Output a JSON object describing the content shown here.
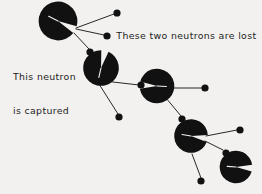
{
  "figure": {
    "kind": "fission-chain-reaction-diagram",
    "background_color": "#f2f1ef",
    "ink_color": "#111111",
    "text_color": "#1d1d1d",
    "width": 262,
    "height": 194,
    "labels": {
      "lost_neutrons": "These two neutrons are lost",
      "captured_neutron_line1": "This neutron",
      "captured_neutron_line2": "is captured"
    },
    "nuclei": [
      {
        "id": "nucleus-1",
        "cx": 58,
        "cy": 21,
        "r": 19,
        "notch_center_deg": 27,
        "notch_half_width_deg": 11
      },
      {
        "id": "nucleus-2",
        "cx": 101,
        "cy": 68,
        "r": 17.5,
        "notch_center_deg": 283,
        "notch_half_width_deg": 12
      },
      {
        "id": "nucleus-3",
        "cx": 157,
        "cy": 86,
        "r": 17,
        "notch_center_deg": 183,
        "notch_half_width_deg": 12
      },
      {
        "id": "nucleus-4",
        "cx": 191,
        "cy": 136,
        "r": 16.5,
        "notch_center_deg": 9,
        "notch_half_width_deg": 12
      },
      {
        "id": "nucleus-5",
        "cx": 236,
        "cy": 167,
        "r": 16,
        "notch_center_deg": 4,
        "notch_half_width_deg": 12
      }
    ],
    "neutrons": [
      {
        "id": "neutron-lost-1",
        "cx": 117,
        "cy": 13,
        "r": 3.6,
        "role": "lost"
      },
      {
        "id": "neutron-lost-2",
        "cx": 107,
        "cy": 36,
        "r": 3.6,
        "role": "lost"
      },
      {
        "id": "neutron-captured-1",
        "cx": 90,
        "cy": 52,
        "r": 3.6,
        "role": "captured"
      },
      {
        "id": "neutron-lost-3",
        "cx": 119,
        "cy": 117,
        "r": 3.6,
        "role": "lost"
      },
      {
        "id": "neutron-captured-2",
        "cx": 141,
        "cy": 85,
        "r": 3.6,
        "role": "captured"
      },
      {
        "id": "neutron-lost-4",
        "cx": 205,
        "cy": 88,
        "r": 3.6,
        "role": "lost"
      },
      {
        "id": "neutron-captured-3",
        "cx": 182,
        "cy": 119,
        "r": 3.6,
        "role": "captured"
      },
      {
        "id": "neutron-lost-5",
        "cx": 240,
        "cy": 130,
        "r": 3.6,
        "role": "lost"
      },
      {
        "id": "neutron-captured-4",
        "cx": 226,
        "cy": 153,
        "r": 3.6,
        "role": "captured"
      },
      {
        "id": "neutron-lost-6",
        "cx": 201,
        "cy": 181,
        "r": 3.6,
        "role": "lost"
      }
    ],
    "tracks": [
      {
        "id": "track-1-lost-1",
        "x1": 76,
        "y1": 28,
        "x2": 114,
        "y2": 14
      },
      {
        "id": "track-1-lost-2",
        "x1": 76,
        "y1": 29,
        "x2": 104,
        "y2": 35
      },
      {
        "id": "track-1-captured",
        "x1": 74,
        "y1": 33,
        "x2": 89,
        "y2": 49
      },
      {
        "id": "track-2-lost-3",
        "x1": 99,
        "y1": 84,
        "x2": 118,
        "y2": 114
      },
      {
        "id": "track-2-captured",
        "x1": 104,
        "y1": 81,
        "x2": 139,
        "y2": 85
      },
      {
        "id": "track-3-lost-4",
        "x1": 172,
        "y1": 88,
        "x2": 202,
        "y2": 88
      },
      {
        "id": "track-3-captured",
        "x1": 166,
        "y1": 98,
        "x2": 181,
        "y2": 116
      },
      {
        "id": "track-4-lost-5",
        "x1": 206,
        "y1": 136,
        "x2": 237,
        "y2": 130
      },
      {
        "id": "track-4-captured",
        "x1": 205,
        "y1": 141,
        "x2": 223,
        "y2": 150
      },
      {
        "id": "track-4-lost-6",
        "x1": 192,
        "y1": 154,
        "x2": 201,
        "y2": 178
      }
    ]
  }
}
